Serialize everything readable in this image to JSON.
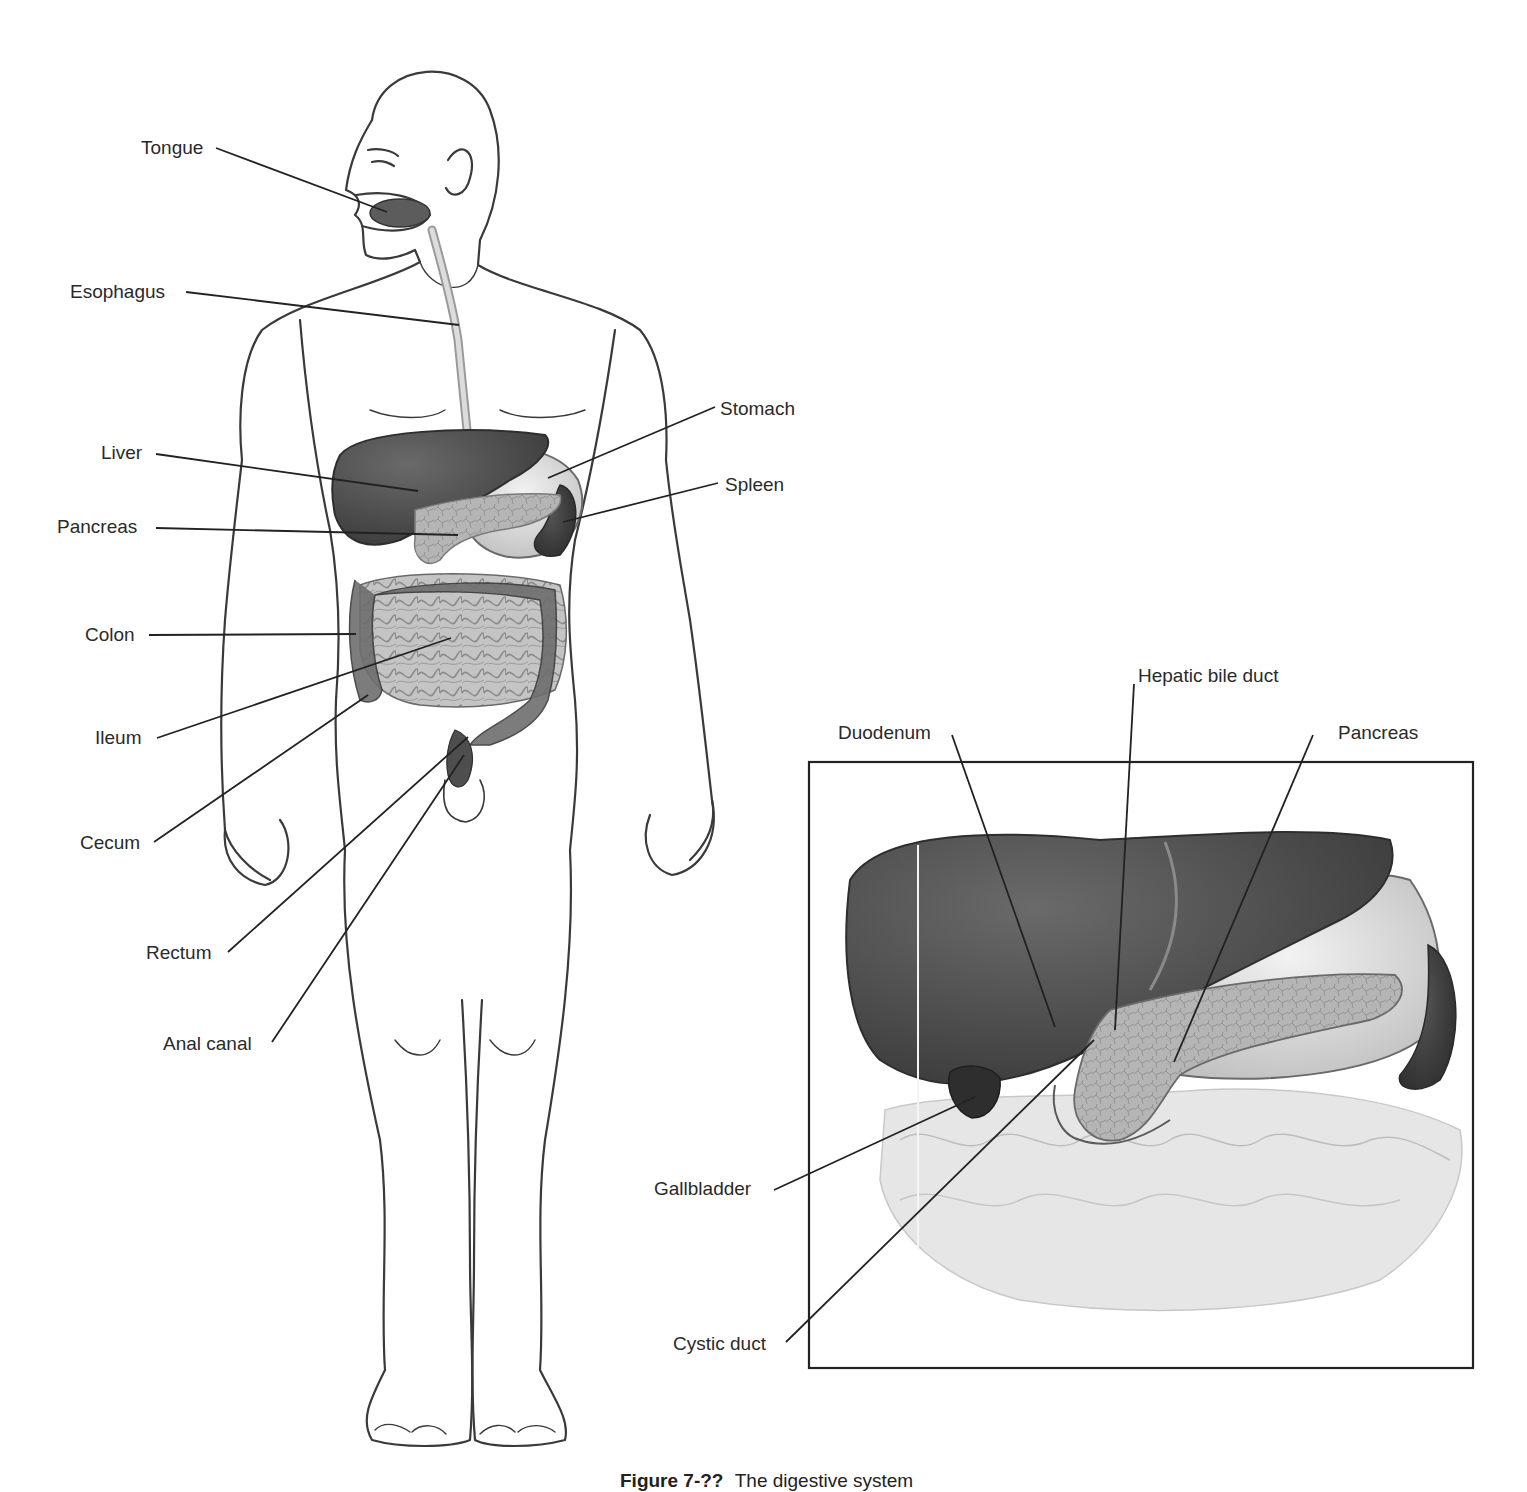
{
  "figure": {
    "caption_number": "Figure 7-?? ",
    "caption_text": "The digestive system",
    "colors": {
      "outline": "#3a3a3a",
      "organ_dark": "#4a4a4a",
      "organ_mid": "#8c8c8c",
      "organ_light": "#cfcfcf",
      "leader": "#222222",
      "inset_border": "#222222"
    }
  },
  "body_labels": [
    {
      "id": "tongue",
      "text": "Tongue",
      "x": 141,
      "y": 138
    },
    {
      "id": "esophagus",
      "text": "Esophagus",
      "x": 70,
      "y": 282
    },
    {
      "id": "liver",
      "text": "Liver",
      "x": 101,
      "y": 443
    },
    {
      "id": "pancreas",
      "text": "Pancreas",
      "x": 57,
      "y": 517
    },
    {
      "id": "colon",
      "text": "Colon",
      "x": 85,
      "y": 625
    },
    {
      "id": "ileum",
      "text": "Ileum",
      "x": 95,
      "y": 728
    },
    {
      "id": "cecum",
      "text": "Cecum",
      "x": 80,
      "y": 833
    },
    {
      "id": "rectum",
      "text": "Rectum",
      "x": 146,
      "y": 943
    },
    {
      "id": "anal-canal",
      "text": "Anal canal",
      "x": 163,
      "y": 1034
    },
    {
      "id": "stomach",
      "text": "Stomach",
      "x": 720,
      "y": 399
    },
    {
      "id": "spleen",
      "text": "Spleen",
      "x": 725,
      "y": 475
    }
  ],
  "inset_labels": [
    {
      "id": "hepatic-bile-duct",
      "text": "Hepatic bile duct",
      "x": 1138,
      "y": 666
    },
    {
      "id": "duodenum",
      "text": "Duodenum",
      "x": 838,
      "y": 723
    },
    {
      "id": "inset-pancreas",
      "text": "Pancreas",
      "x": 1338,
      "y": 723
    },
    {
      "id": "gallbladder",
      "text": "Gallbladder",
      "x": 654,
      "y": 1179
    },
    {
      "id": "cystic-duct",
      "text": "Cystic duct",
      "x": 673,
      "y": 1334
    }
  ],
  "leaders": [
    {
      "for": "tongue",
      "x1": 216,
      "y1": 148,
      "x2": 387,
      "y2": 212
    },
    {
      "for": "esophagus",
      "x1": 186,
      "y1": 292,
      "x2": 459,
      "y2": 325
    },
    {
      "for": "liver",
      "x1": 156,
      "y1": 454,
      "x2": 418,
      "y2": 491
    },
    {
      "for": "pancreas",
      "x1": 156,
      "y1": 528,
      "x2": 458,
      "y2": 535
    },
    {
      "for": "colon",
      "x1": 149,
      "y1": 635,
      "x2": 356,
      "y2": 634
    },
    {
      "for": "ileum",
      "x1": 157,
      "y1": 738,
      "x2": 451,
      "y2": 638
    },
    {
      "for": "cecum",
      "x1": 154,
      "y1": 842,
      "x2": 368,
      "y2": 695
    },
    {
      "for": "rectum",
      "x1": 228,
      "y1": 952,
      "x2": 468,
      "y2": 737
    },
    {
      "for": "anal-canal",
      "x1": 272,
      "y1": 1042,
      "x2": 464,
      "y2": 755
    },
    {
      "for": "stomach",
      "x1": 715,
      "y1": 407,
      "x2": 548,
      "y2": 478
    },
    {
      "for": "spleen",
      "x1": 718,
      "y1": 483,
      "x2": 563,
      "y2": 522
    },
    {
      "for": "hepatic-bile-duct",
      "x1": 1134,
      "y1": 684,
      "x2": 1115,
      "y2": 1030
    },
    {
      "for": "duodenum",
      "x1": 952,
      "y1": 735,
      "x2": 1055,
      "y2": 1027
    },
    {
      "for": "inset-pancreas",
      "x1": 1313,
      "y1": 735,
      "x2": 1174,
      "y2": 1062
    },
    {
      "for": "gallbladder",
      "x1": 774,
      "y1": 1190,
      "x2": 975,
      "y2": 1097
    },
    {
      "for": "cystic-duct",
      "x1": 786,
      "y1": 1342,
      "x2": 1094,
      "y2": 1040
    }
  ],
  "inset_box": {
    "x": 809,
    "y": 762,
    "width": 664,
    "height": 606
  }
}
